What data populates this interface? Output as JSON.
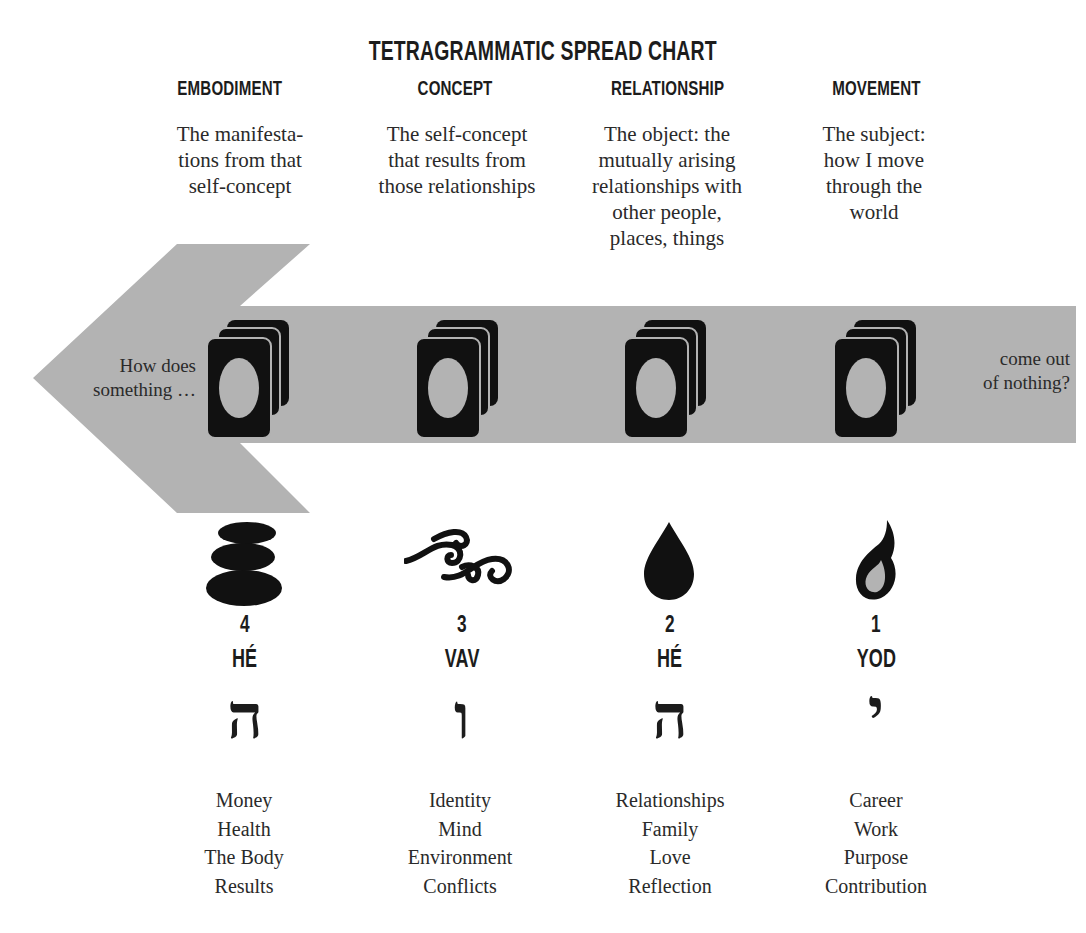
{
  "title": "TETRAGRAMMATIC SPREAD CHART",
  "arrow": {
    "color": "#b3b3b3",
    "left_text": [
      "How does",
      "something …"
    ],
    "right_text": [
      "come out",
      "of nothing?"
    ]
  },
  "columns": [
    {
      "heading": "EMBODIMENT",
      "description": [
        "The manifesta-",
        "tions from that",
        "self-concept"
      ],
      "symbol": "stacked-stones-icon",
      "number": "4",
      "letter_name": "HÉ",
      "hebrew": "ה",
      "items": [
        "Money",
        "Health",
        "The Body",
        "Results"
      ]
    },
    {
      "heading": "CONCEPT",
      "description": [
        "The self-concept",
        "that results from",
        "those relationships"
      ],
      "symbol": "air-swirls-icon",
      "number": "3",
      "letter_name": "VAV",
      "hebrew": "ו",
      "items": [
        "Identity",
        "Mind",
        "Environment",
        "Conflicts"
      ]
    },
    {
      "heading": "RELATIONSHIP",
      "description": [
        "The object: the",
        "mutually arising",
        "relationships with",
        "other people,",
        "places, things"
      ],
      "symbol": "water-drop-icon",
      "number": "2",
      "letter_name": "HÉ",
      "hebrew": "ה",
      "items": [
        "Relationships",
        "Family",
        "Love",
        "Reflection"
      ]
    },
    {
      "heading": "MOVEMENT",
      "description": [
        "The subject:",
        "how I move",
        "through the",
        "world"
      ],
      "symbol": "flame-icon",
      "number": "1",
      "letter_name": "YOD",
      "hebrew": "י",
      "items": [
        "Career",
        "Work",
        "Purpose",
        "Contribution"
      ]
    }
  ]
}
